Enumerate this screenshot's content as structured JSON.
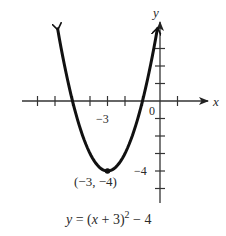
{
  "chart_data": {
    "type": "line",
    "title": "",
    "equation": "y = (x + 3)^2 - 4",
    "equation_display": {
      "prefix": "y = (x + 3)",
      "exponent": "2",
      "suffix": " − 4"
    },
    "xlabel": "x",
    "ylabel": "y",
    "origin_label": "0",
    "x_tick_label": "−3",
    "y_tick_label": "−4",
    "vertex": {
      "x": -3,
      "y": -4,
      "label": "(−3, −4)"
    },
    "xlim": [
      -7,
      1
    ],
    "ylim": [
      -6,
      4
    ],
    "x_ticks": [
      -7,
      -6,
      -5,
      -4,
      -3,
      -2,
      -1,
      1
    ],
    "y_ticks": [
      -5,
      -4,
      -3,
      -2,
      -1,
      1,
      2,
      3
    ],
    "grid": false,
    "series": [
      {
        "name": "y = (x + 3)^2 - 4",
        "x": [
          -5.85,
          -5,
          -4,
          -3,
          -2,
          -1,
          -0.15
        ],
        "y": [
          4.12,
          0,
          -3,
          -4,
          -3,
          0,
          4.12
        ]
      }
    ],
    "colors": {
      "curve": "#111111",
      "axes": "#333333"
    }
  }
}
